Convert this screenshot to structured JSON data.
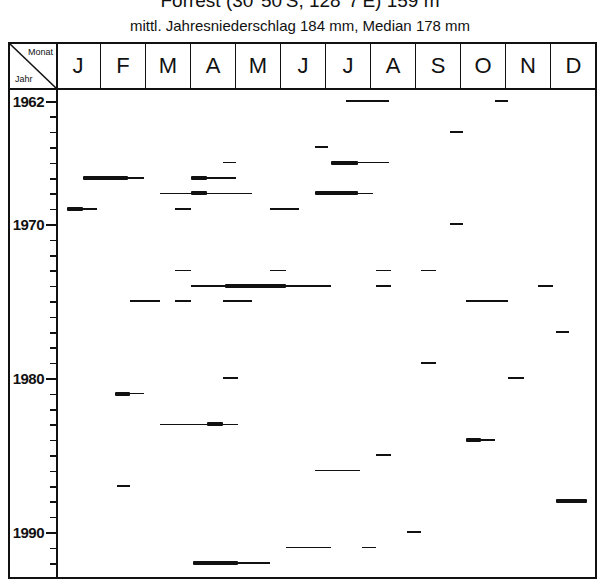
{
  "title": "Forrest (30°50'S, 128°7'E) 159 m",
  "subtitle": "mittl. Jahresniederschlag 184 mm, Median 178 mm",
  "chart_data": {
    "type": "table",
    "title": "Forrest (30°50'S, 128°7'E) 159 m",
    "subtitle": "mittl. Jahresniederschlag 184 mm, Median 178 mm",
    "corner_labels": {
      "top": "Monat",
      "bottom": "Jahr"
    },
    "months": [
      "J",
      "F",
      "M",
      "A",
      "M",
      "J",
      "J",
      "A",
      "S",
      "O",
      "N",
      "D"
    ],
    "year_range": [
      1962,
      1992
    ],
    "year_labels": [
      1962,
      1970,
      1980,
      1990
    ],
    "segments": [
      {
        "year": 1962,
        "start": 6.45,
        "end": 7.4,
        "weight": "thin"
      },
      {
        "year": 1962,
        "start": 9.75,
        "end": 10.05,
        "weight": "thin"
      },
      {
        "year": 1964,
        "start": 8.75,
        "end": 9.05,
        "weight": "thin"
      },
      {
        "year": 1965,
        "start": 5.75,
        "end": 6.05,
        "weight": "thin"
      },
      {
        "year": 1966,
        "start": 3.7,
        "end": 4.0,
        "weight": "thin"
      },
      {
        "year": 1966,
        "start": 6.1,
        "end": 6.7,
        "weight": "bold"
      },
      {
        "year": 1966,
        "start": 6.7,
        "end": 7.4,
        "weight": "thin"
      },
      {
        "year": 1967,
        "start": 0.6,
        "end": 1.6,
        "weight": "bold"
      },
      {
        "year": 1967,
        "start": 1.6,
        "end": 1.95,
        "weight": "thin"
      },
      {
        "year": 1967,
        "start": 3.0,
        "end": 3.35,
        "weight": "bold"
      },
      {
        "year": 1967,
        "start": 3.35,
        "end": 4.0,
        "weight": "thin"
      },
      {
        "year": 1968,
        "start": 2.3,
        "end": 3.0,
        "weight": "thin"
      },
      {
        "year": 1968,
        "start": 3.0,
        "end": 3.35,
        "weight": "bold"
      },
      {
        "year": 1968,
        "start": 3.35,
        "end": 4.35,
        "weight": "thin"
      },
      {
        "year": 1968,
        "start": 5.75,
        "end": 6.7,
        "weight": "bold"
      },
      {
        "year": 1968,
        "start": 6.7,
        "end": 7.05,
        "weight": "thin"
      },
      {
        "year": 1969,
        "start": 0.25,
        "end": 0.6,
        "weight": "bold"
      },
      {
        "year": 1969,
        "start": 0.6,
        "end": 0.9,
        "weight": "thin"
      },
      {
        "year": 1969,
        "start": 2.65,
        "end": 3.0,
        "weight": "thin"
      },
      {
        "year": 1969,
        "start": 4.75,
        "end": 5.4,
        "weight": "thin"
      },
      {
        "year": 1970,
        "start": 8.75,
        "end": 9.05,
        "weight": "thin"
      },
      {
        "year": 1973,
        "start": 2.65,
        "end": 3.0,
        "weight": "thin"
      },
      {
        "year": 1973,
        "start": 4.75,
        "end": 5.1,
        "weight": "thin"
      },
      {
        "year": 1973,
        "start": 7.1,
        "end": 7.45,
        "weight": "thin"
      },
      {
        "year": 1973,
        "start": 8.1,
        "end": 8.45,
        "weight": "thin"
      },
      {
        "year": 1974,
        "start": 3.0,
        "end": 3.75,
        "weight": "thin"
      },
      {
        "year": 1974,
        "start": 3.75,
        "end": 5.1,
        "weight": "bold"
      },
      {
        "year": 1974,
        "start": 5.1,
        "end": 6.1,
        "weight": "thin"
      },
      {
        "year": 1974,
        "start": 7.1,
        "end": 7.45,
        "weight": "thin"
      },
      {
        "year": 1974,
        "start": 10.7,
        "end": 11.05,
        "weight": "thin"
      },
      {
        "year": 1975,
        "start": 1.65,
        "end": 2.3,
        "weight": "thin"
      },
      {
        "year": 1975,
        "start": 2.65,
        "end": 3.0,
        "weight": "thin"
      },
      {
        "year": 1975,
        "start": 3.7,
        "end": 4.35,
        "weight": "thin"
      },
      {
        "year": 1975,
        "start": 9.1,
        "end": 10.05,
        "weight": "thin"
      },
      {
        "year": 1977,
        "start": 11.1,
        "end": 11.4,
        "weight": "thin"
      },
      {
        "year": 1979,
        "start": 8.1,
        "end": 8.45,
        "weight": "thin"
      },
      {
        "year": 1980,
        "start": 3.7,
        "end": 4.05,
        "weight": "thin"
      },
      {
        "year": 1980,
        "start": 10.05,
        "end": 10.4,
        "weight": "thin"
      },
      {
        "year": 1981,
        "start": 1.3,
        "end": 1.65,
        "weight": "bold"
      },
      {
        "year": 1981,
        "start": 1.65,
        "end": 1.95,
        "weight": "thin"
      },
      {
        "year": 1983,
        "start": 2.3,
        "end": 3.35,
        "weight": "thin"
      },
      {
        "year": 1983,
        "start": 3.35,
        "end": 3.7,
        "weight": "bold"
      },
      {
        "year": 1983,
        "start": 3.7,
        "end": 4.05,
        "weight": "thin"
      },
      {
        "year": 1984,
        "start": 9.1,
        "end": 9.45,
        "weight": "bold"
      },
      {
        "year": 1984,
        "start": 9.45,
        "end": 9.75,
        "weight": "thin"
      },
      {
        "year": 1985,
        "start": 7.1,
        "end": 7.45,
        "weight": "thin"
      },
      {
        "year": 1986,
        "start": 5.75,
        "end": 6.75,
        "weight": "thin"
      },
      {
        "year": 1987,
        "start": 1.35,
        "end": 1.65,
        "weight": "thin"
      },
      {
        "year": 1988,
        "start": 11.1,
        "end": 11.8,
        "weight": "bold"
      },
      {
        "year": 1990,
        "start": 7.8,
        "end": 8.1,
        "weight": "thin"
      },
      {
        "year": 1991,
        "start": 5.1,
        "end": 6.1,
        "weight": "thin"
      },
      {
        "year": 1991,
        "start": 6.8,
        "end": 7.1,
        "weight": "thin"
      },
      {
        "year": 1992,
        "start": 3.05,
        "end": 4.05,
        "weight": "bold"
      },
      {
        "year": 1992,
        "start": 4.05,
        "end": 4.75,
        "weight": "thin"
      }
    ]
  }
}
